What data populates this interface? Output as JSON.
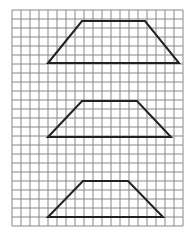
{
  "diagram": {
    "title": "",
    "colors": {
      "background": "#ffffff",
      "grid": "#888888",
      "shape": "#222222"
    },
    "grid": {
      "x0": 12,
      "y0": 10,
      "cols": 19,
      "rows": 24,
      "cell": 9
    },
    "shapes": [
      {
        "name": "trapezoid-1",
        "points": [
          [
            48,
            63
          ],
          [
            82,
            21
          ],
          [
            145,
            21
          ],
          [
            179,
            63
          ]
        ]
      },
      {
        "name": "trapezoid-2",
        "points": [
          [
            48,
            137
          ],
          [
            82,
            101
          ],
          [
            137,
            101
          ],
          [
            171,
            137
          ]
        ]
      },
      {
        "name": "trapezoid-3",
        "points": [
          [
            48,
            217
          ],
          [
            83,
            181
          ],
          [
            128,
            181
          ],
          [
            163,
            217
          ]
        ]
      }
    ]
  }
}
